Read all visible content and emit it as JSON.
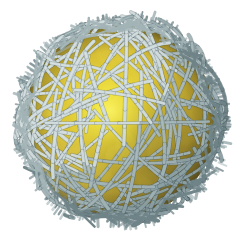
{
  "figure": {
    "kind": "3d-rendered-illustration",
    "background_color": "#ffffff",
    "canvas": {
      "width": 241,
      "height": 241
    },
    "caption": "",
    "title": "",
    "labels": [],
    "annotations": []
  },
  "sphere": {
    "center_x": 120,
    "center_y": 121,
    "radius": 96,
    "highlight_x": 108,
    "highlight_y": 107,
    "highlight_radius": 34,
    "colors": {
      "highlight": "#f2e63f",
      "bright": "#e8d53a",
      "mid": "#d4bb34",
      "shade": "#b49b2e",
      "dark": "#8f7a2c",
      "edge": "#6e5f26",
      "rim": "#5c5024"
    }
  },
  "fibers": {
    "count": 210,
    "stroke_width_min": 2.4,
    "stroke_width_max": 3.6,
    "halo_extend": 14,
    "colors": {
      "light": "#cdd8da",
      "base": "#a3b4b7",
      "mid": "#8fa3a7",
      "dark": "#6f8488",
      "shadow": "#53686d",
      "outline": "#46585c"
    },
    "seed": 20240515
  },
  "lighting": {
    "key_direction": "upper-left",
    "terminator": "lower-right",
    "ambient_tint": "#efe9c6"
  }
}
